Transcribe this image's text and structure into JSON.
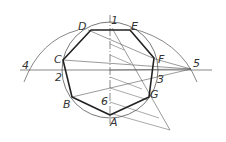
{
  "diagram": {
    "vertex_labels": {
      "A": "A",
      "B": "B",
      "C": "C",
      "D": "D",
      "E": "E",
      "F": "F",
      "G": "G"
    },
    "division_labels": {
      "p1": "1",
      "p2": "2",
      "p3": "3",
      "p4": "4",
      "p5": "5",
      "p6": "6"
    },
    "colors": {
      "line": "#444444",
      "polygon": "#222222",
      "background": "#ffffff"
    }
  }
}
